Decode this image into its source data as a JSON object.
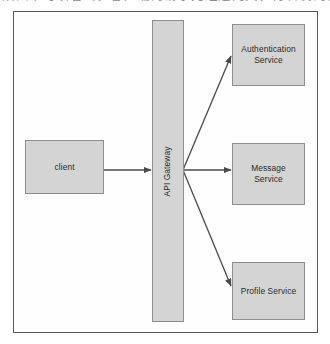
{
  "figure": {
    "caption_above": "从图中可以看出，客户端的请求先经过网关，再转发到各个微服务",
    "frame": {
      "label": "diagram-border"
    }
  },
  "nodes": {
    "client": {
      "label": "client"
    },
    "api_gateway": {
      "label": "API Gateway"
    },
    "authentication_service": {
      "label_line1": "Authentication",
      "label_line2": "Service"
    },
    "message_service": {
      "label_line1": "Message",
      "label_line2": "Service"
    },
    "profile_service": {
      "label": "Profile Service"
    }
  },
  "edges": [
    {
      "name": "client-to-gateway",
      "from": "client",
      "to": "api_gateway",
      "style": "solid-arrow"
    },
    {
      "name": "gateway-to-authentication",
      "from": "api_gateway",
      "to": "authentication_service",
      "style": "solid-arrow"
    },
    {
      "name": "gateway-to-message",
      "from": "api_gateway",
      "to": "message_service",
      "style": "solid-arrow"
    },
    {
      "name": "gateway-to-profile",
      "from": "api_gateway",
      "to": "profile_service",
      "style": "solid-arrow"
    }
  ],
  "colors": {
    "node_fill": "#d4d4d4",
    "node_stroke": "#8e8e8e",
    "frame_stroke": "#5a5a5a",
    "arrow_stroke": "#4a4a4a",
    "text": "#2b2b2b",
    "background": "#ffffff"
  }
}
